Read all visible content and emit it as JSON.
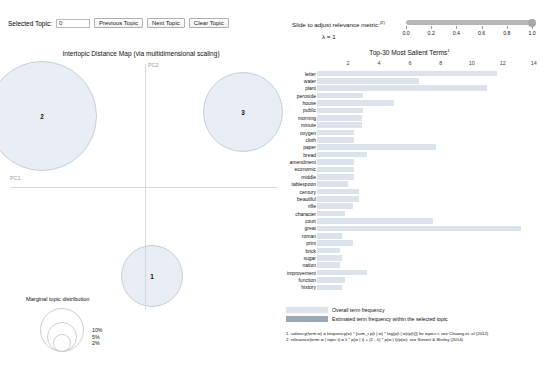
{
  "controls": {
    "selected_topic_label": "Selected Topic:",
    "selected_topic_value": "0",
    "previous_topic": "Previous Topic",
    "next_topic": "Next Topic",
    "clear_topic": "Clear Topic"
  },
  "relevance": {
    "title": "Slide to adjust relevance metric:",
    "title_superscript": "(2)",
    "lambda_text": "λ = 1",
    "slider_value": 1.0,
    "ticks": [
      "0.0",
      "0.2",
      "0.4",
      "0.6",
      "0.8",
      "1.0"
    ]
  },
  "map": {
    "title": "Intertopic Distance Map (via multidimensional scaling)",
    "x_axis_label": "PC1",
    "y_axis_label": "PC2",
    "topics": [
      {
        "id": "2",
        "cx": 42,
        "cy": 54,
        "r": 55
      },
      {
        "id": "3",
        "cx": 243,
        "cy": 50,
        "r": 40
      },
      {
        "id": "1",
        "cx": 152,
        "cy": 214,
        "r": 31
      }
    ],
    "marginal_legend": {
      "title": "Marginal topic distribution",
      "sizes": [
        "2%",
        "5%",
        "10%"
      ]
    }
  },
  "terms": {
    "title": "Top-30 Most Salient Terms",
    "title_superscript": "1",
    "legend": {
      "overall": "Overall term frequency",
      "estimated": "Estimated term frequency within the selected topic"
    },
    "footnotes": [
      "1. saliency(term w) = frequency(w) * [sum_t p(t | w) * log(p(t | w)/p(t))] for topics t; see Chuang et. al (2012)",
      "2. relevance(term w | topic t) = λ * p(w | t) + (1 - λ) * p(w | t)/p(w); see Sievert & Shirley (2014)"
    ]
  },
  "chart_data": {
    "type": "bar",
    "title": "Top-30 Most Salient Terms",
    "xlabel": "",
    "ylabel": "",
    "xlim": [
      0,
      14.6
    ],
    "xticks": [
      2,
      4,
      6,
      8,
      10,
      12,
      14
    ],
    "grid": false,
    "legend_position": "bottom",
    "orientation": "horizontal",
    "categories": [
      "letter",
      "water",
      "plant",
      "peroxide",
      "house",
      "public",
      "morning",
      "minute",
      "oxygen",
      "cloth",
      "paper",
      "bread",
      "amendment",
      "economic",
      "middle",
      "tablespoon",
      "century",
      "beautiful",
      "rifle",
      "character",
      "court",
      "great",
      "roman",
      "print",
      "brick",
      "sugar",
      "nation",
      "improvement",
      "function",
      "history"
    ],
    "series": [
      {
        "name": "Overall term frequency",
        "values": [
          11.6,
          6.6,
          11.0,
          3.0,
          5.0,
          3.0,
          2.9,
          2.9,
          2.4,
          2.4,
          7.7,
          3.2,
          2.4,
          2.4,
          2.4,
          2.0,
          2.7,
          2.7,
          2.3,
          1.8,
          7.5,
          13.2,
          1.6,
          2.3,
          1.5,
          1.6,
          1.5,
          3.2,
          1.8,
          1.6
        ]
      }
    ]
  }
}
